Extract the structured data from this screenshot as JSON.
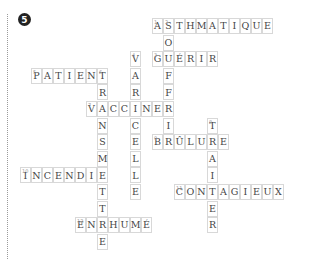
{
  "exercise_number": "5",
  "grid": {
    "cell_w": 11,
    "cell_h": 16.6
  },
  "words": [
    {
      "number": "1",
      "word": "ASTHMATIQUE",
      "dir": "across",
      "row": 0,
      "col": 12
    },
    {
      "number": "2",
      "word": "SOUFFRIR",
      "dir": "down",
      "row": 0,
      "col": 13
    },
    {
      "number": "3",
      "word": "GUÉRIR",
      "dir": "across",
      "row": 2,
      "col": 12
    },
    {
      "number": "4",
      "word": "VARICELLE",
      "dir": "down",
      "row": 2,
      "col": 10
    },
    {
      "number": "5",
      "word": "PATIENT",
      "dir": "across",
      "row": 3,
      "col": 1
    },
    {
      "number": "6",
      "word": "TRANSMETTRE",
      "dir": "down",
      "row": 3,
      "col": 7
    },
    {
      "number": "7",
      "word": "VACCINER",
      "dir": "across",
      "row": 5,
      "col": 6
    },
    {
      "number": "8",
      "word": "TRAITER",
      "dir": "down",
      "row": 6,
      "col": 17
    },
    {
      "number": "9",
      "word": "BRÛLURE",
      "dir": "across",
      "row": 7,
      "col": 12
    },
    {
      "number": "10",
      "word": "INCENDIE",
      "dir": "across",
      "row": 9,
      "col": 0
    },
    {
      "number": "11",
      "word": "CONTAGIEUX",
      "dir": "across",
      "row": 10,
      "col": 14
    },
    {
      "number": "12",
      "word": "ENRHUMÉ",
      "dir": "across",
      "row": 12,
      "col": 5
    }
  ]
}
